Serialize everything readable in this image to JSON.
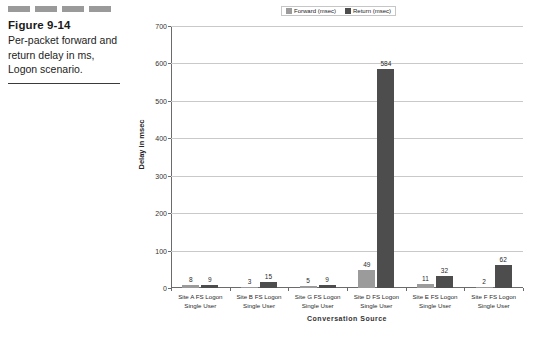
{
  "caption": {
    "figure_number": "Figure 9-14",
    "text": "Per-packet forward and return delay in ms, Logon scenario.",
    "decor_bar_count": 4,
    "decor_bar_color": "#9a9a9a"
  },
  "chart_data": {
    "type": "bar",
    "title": "",
    "xlabel": "Conversation Source",
    "ylabel": "Delay in msec",
    "categories": [
      "Site A FS Logon Single User",
      "Site B FS Logon Single User",
      "Site G FS Logon Single User",
      "Site D FS Logon Single User",
      "Site E FS Logon Single User",
      "Site F FS Logon Single User"
    ],
    "series": [
      {
        "name": "Forward (msec)",
        "color": "#9b9b9b",
        "values": [
          8,
          3,
          5,
          49,
          11,
          2
        ]
      },
      {
        "name": "Return (msec)",
        "color": "#4d4d4d",
        "values": [
          9,
          15,
          9,
          584,
          32,
          62
        ]
      }
    ],
    "ylim": [
      0,
      700
    ],
    "yticks": [
      0,
      100,
      200,
      300,
      400,
      500,
      600,
      700
    ],
    "grid": true,
    "legend_position": "top-right"
  }
}
